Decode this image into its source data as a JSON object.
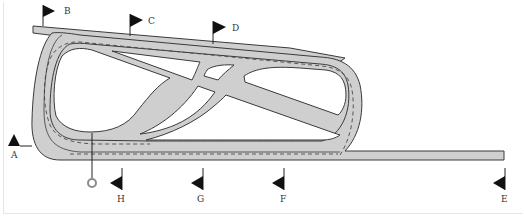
{
  "diagram": {
    "type": "racecourse-layout",
    "colors": {
      "track_fill": "#cfcfcf",
      "track_outline": "#3a3a3a",
      "rail_dash": "#4a4a4a",
      "flag": "#111111",
      "winning_post": "#8a8a8a",
      "background": "#ffffff"
    },
    "markers": [
      {
        "id": "A",
        "label": "A"
      },
      {
        "id": "B",
        "label": "B"
      },
      {
        "id": "C",
        "label": "C"
      },
      {
        "id": "D",
        "label": "D"
      },
      {
        "id": "E",
        "label": "E"
      },
      {
        "id": "F",
        "label": "F"
      },
      {
        "id": "G",
        "label": "G"
      },
      {
        "id": "H",
        "label": "H"
      }
    ],
    "features": {
      "winning_post": "winning-post-circle",
      "inner_rail": "dashed-rail",
      "straight_course": "bottom-straight",
      "back_chute": "top-chute"
    }
  }
}
